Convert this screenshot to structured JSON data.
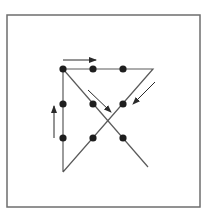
{
  "diagram": {
    "title": "",
    "colors": {
      "frame": "#6e6e6e",
      "line": "#5a5a5a",
      "dot": "#1e1e1e",
      "arrow": "#2a2a2a",
      "background": "#ffffff"
    },
    "frame": {
      "x": 7,
      "y": 15,
      "width": 193,
      "height": 192
    },
    "dots": [
      {
        "row": 1,
        "col": 1,
        "x": 63,
        "y": 69
      },
      {
        "row": 1,
        "col": 2,
        "x": 93,
        "y": 69
      },
      {
        "row": 1,
        "col": 3,
        "x": 123,
        "y": 69
      },
      {
        "row": 2,
        "col": 1,
        "x": 63,
        "y": 104
      },
      {
        "row": 2,
        "col": 2,
        "x": 93,
        "y": 104
      },
      {
        "row": 2,
        "col": 3,
        "x": 123,
        "y": 104
      },
      {
        "row": 3,
        "col": 1,
        "x": 63,
        "y": 138
      },
      {
        "row": 3,
        "col": 2,
        "x": 93,
        "y": 138
      },
      {
        "row": 3,
        "col": 3,
        "x": 123,
        "y": 138
      }
    ],
    "path": [
      {
        "x": 63,
        "y": 172
      },
      {
        "x": 63,
        "y": 69
      },
      {
        "x": 153,
        "y": 69
      },
      {
        "x": 63,
        "y": 172
      }
    ],
    "cross_line": {
      "x1": 63,
      "y1": 69,
      "x2": 148,
      "y2": 167
    },
    "arrows": [
      {
        "name": "arrow-right",
        "x1": 63,
        "y1": 60,
        "x2": 96,
        "y2": 60
      },
      {
        "name": "arrow-up",
        "x1": 54,
        "y1": 138,
        "x2": 54,
        "y2": 106
      },
      {
        "name": "arrow-down-right",
        "x1": 88,
        "y1": 90,
        "x2": 111,
        "y2": 112
      },
      {
        "name": "arrow-down-left",
        "x1": 155,
        "y1": 82,
        "x2": 133,
        "y2": 104
      }
    ]
  }
}
